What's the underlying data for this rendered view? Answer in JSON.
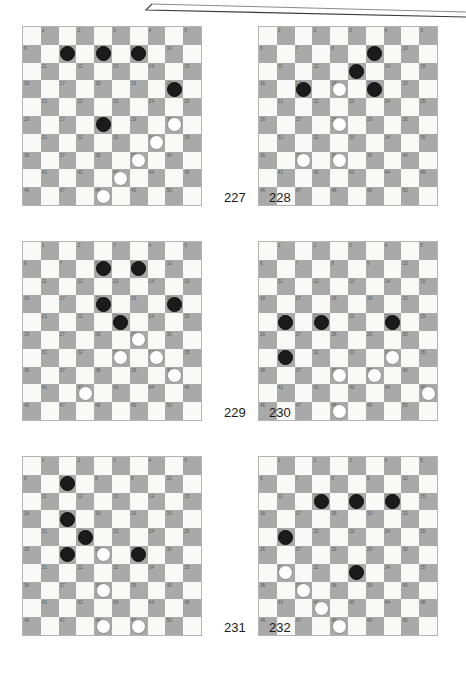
{
  "page": {
    "kind": "draughts-puzzle-sheet",
    "board_size": 10,
    "numbered_squares": 50,
    "colors": {
      "dark_square": "#a9a9a9",
      "light_square": "#f9f9f7",
      "black_piece": "#1b1b1b",
      "white_piece": "#ffffff",
      "square_number": "#5f5f5f",
      "board_border": "#b4b4b4"
    }
  },
  "boards": [
    {
      "id": "board-227",
      "label": "227",
      "black": [
        7,
        8,
        9,
        20,
        28
      ],
      "white": [
        30,
        34,
        39,
        43,
        48
      ]
    },
    {
      "id": "board-228",
      "label": "228",
      "black": [
        9,
        13,
        17,
        19
      ],
      "white": [
        18,
        28,
        37,
        38
      ]
    },
    {
      "id": "board-229",
      "label": "229",
      "black": [
        8,
        9,
        18,
        20,
        23
      ],
      "white": [
        29,
        33,
        34,
        40,
        42
      ]
    },
    {
      "id": "board-230",
      "label": "230",
      "black": [
        21,
        22,
        24,
        31
      ],
      "white": [
        34,
        38,
        39,
        45,
        48
      ]
    },
    {
      "id": "board-231",
      "label": "231",
      "black": [
        7,
        17,
        22,
        27,
        29
      ],
      "white": [
        28,
        38,
        48,
        49
      ]
    },
    {
      "id": "board-232",
      "label": "232",
      "black": [
        12,
        13,
        14,
        21,
        33
      ],
      "white": [
        31,
        37,
        42,
        48
      ]
    }
  ],
  "captions": [
    {
      "id": "caption-227-228",
      "left": "227",
      "right": "228"
    },
    {
      "id": "caption-229-230",
      "left": "229",
      "right": "230"
    },
    {
      "id": "caption-231-232",
      "left": "231",
      "right": "232"
    }
  ]
}
